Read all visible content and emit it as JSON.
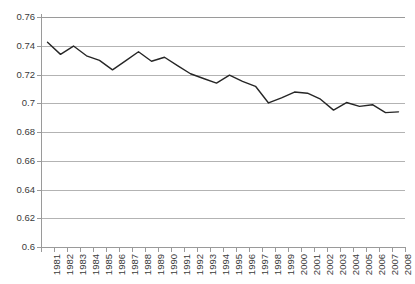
{
  "chart_data": {
    "type": "line",
    "title": "",
    "xlabel": "",
    "ylabel": "",
    "grid": "horizontal",
    "legend": "none",
    "ylim": [
      0.6,
      0.76
    ],
    "yticks": [
      "0.76",
      "0.74",
      "0.72",
      "0.7",
      "0.68",
      "0.66",
      "0.64",
      "0.62",
      "0.6"
    ],
    "ytick_values": [
      0.76,
      0.74,
      0.72,
      0.7,
      0.68,
      0.66,
      0.64,
      0.62,
      0.6
    ],
    "categories": [
      "1981",
      "1982",
      "1983",
      "1984",
      "1985",
      "1986",
      "1987",
      "1988",
      "1989",
      "1990",
      "1991",
      "1992",
      "1993",
      "1994",
      "1995",
      "1996",
      "1997",
      "1998",
      "1999",
      "2000",
      "2001",
      "2002",
      "2003",
      "2004",
      "2005",
      "2006",
      "2007",
      "2008"
    ],
    "series": [
      {
        "name": "series-1",
        "color": "#262626",
        "values": [
          0.7425,
          0.734,
          0.7398,
          0.733,
          0.7298,
          0.7232,
          0.7295,
          0.7358,
          0.7292,
          0.732,
          0.7262,
          0.7205,
          0.7172,
          0.714,
          0.7195,
          0.7152,
          0.7118,
          0.7002,
          0.7038,
          0.7078,
          0.707,
          0.7028,
          0.6952,
          0.7005,
          0.6978,
          0.699,
          0.6935,
          0.694
        ]
      }
    ]
  },
  "style": {
    "gridline_color": "#b3b3b3",
    "axis_color": "#9a9a9a",
    "line_color": "#262626",
    "label_color": "#3a3a3a",
    "background": "#ffffff"
  }
}
